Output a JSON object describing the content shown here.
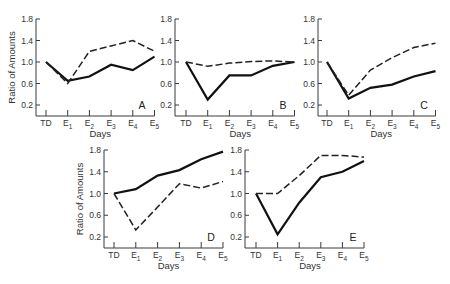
{
  "chart_data": [
    {
      "type": "line",
      "panel": "A",
      "categories": [
        "TD",
        "E1",
        "E2",
        "E3",
        "E4",
        "E5"
      ],
      "series": [
        {
          "name": "solid",
          "values": [
            1.0,
            0.65,
            0.73,
            0.95,
            0.85,
            1.1
          ]
        },
        {
          "name": "dashed",
          "values": [
            1.0,
            0.6,
            1.2,
            1.3,
            1.4,
            1.2
          ]
        }
      ],
      "xlabel": "Days",
      "ylabel": "Ratio of Amounts",
      "yticks": [
        0.2,
        0.6,
        1.0,
        1.4,
        1.8
      ],
      "ylim": [
        0.0,
        1.8
      ]
    },
    {
      "type": "line",
      "panel": "B",
      "categories": [
        "TD",
        "E1",
        "E2",
        "E3",
        "E4",
        "E5"
      ],
      "series": [
        {
          "name": "solid",
          "values": [
            1.0,
            0.3,
            0.75,
            0.75,
            0.93,
            1.0
          ]
        },
        {
          "name": "dashed",
          "values": [
            1.0,
            0.92,
            0.98,
            1.01,
            1.02,
            1.0
          ]
        }
      ],
      "xlabel": "Days",
      "ylabel": "",
      "yticks": [
        0.2,
        0.6,
        1.0,
        1.4,
        1.8
      ],
      "ylim": [
        0.0,
        1.8
      ]
    },
    {
      "type": "line",
      "panel": "C",
      "categories": [
        "TD",
        "E1",
        "E2",
        "E3",
        "E4",
        "E5"
      ],
      "series": [
        {
          "name": "solid",
          "values": [
            1.0,
            0.32,
            0.52,
            0.58,
            0.73,
            0.83
          ]
        },
        {
          "name": "dashed",
          "values": [
            1.0,
            0.38,
            0.85,
            1.08,
            1.27,
            1.35
          ]
        }
      ],
      "xlabel": "Days",
      "ylabel": "",
      "yticks": [
        0.2,
        0.6,
        1.0,
        1.4,
        1.8
      ],
      "ylim": [
        0.0,
        1.8
      ]
    },
    {
      "type": "line",
      "panel": "D",
      "categories": [
        "TD",
        "E1",
        "E2",
        "E3",
        "E4",
        "E5"
      ],
      "series": [
        {
          "name": "solid",
          "values": [
            1.0,
            1.08,
            1.33,
            1.43,
            1.63,
            1.77
          ]
        },
        {
          "name": "dashed",
          "values": [
            1.0,
            0.33,
            0.75,
            1.18,
            1.1,
            1.22
          ]
        }
      ],
      "xlabel": "Days",
      "ylabel": "Ratio of Amounts",
      "yticks": [
        0.2,
        0.6,
        1.0,
        1.4,
        1.8
      ],
      "ylim": [
        0.0,
        1.8
      ]
    },
    {
      "type": "line",
      "panel": "E",
      "categories": [
        "TD",
        "E1",
        "E2",
        "E3",
        "E4",
        "E5"
      ],
      "series": [
        {
          "name": "solid",
          "values": [
            1.0,
            0.25,
            0.83,
            1.3,
            1.4,
            1.6
          ]
        },
        {
          "name": "dashed",
          "values": [
            1.0,
            1.0,
            1.33,
            1.7,
            1.7,
            1.67
          ]
        }
      ],
      "xlabel": "Days",
      "ylabel": "",
      "yticks": [
        0.2,
        0.6,
        1.0,
        1.4,
        1.8
      ],
      "ylim": [
        0.0,
        1.8
      ]
    }
  ],
  "layout": {
    "panels": [
      {
        "ax": 36,
        "ay0": 116,
        "y18": 19,
        "y02": 105,
        "x0": 46,
        "dx": 21.7,
        "showYLabel": true,
        "labelPos": [
          142,
          109
        ]
      },
      {
        "ax": 175,
        "ay0": 116,
        "y18": 19,
        "y02": 105,
        "x0": 186,
        "dx": 21.7,
        "showYLabel": false,
        "labelPos": [
          283,
          109
        ]
      },
      {
        "ax": 318,
        "ay0": 116,
        "y18": 19,
        "y02": 105,
        "x0": 327,
        "dx": 21.7,
        "showYLabel": false,
        "labelPos": [
          424,
          109
        ]
      },
      {
        "ax": 104,
        "ay0": 248,
        "y18": 150,
        "y02": 237,
        "x0": 114,
        "dx": 21.8,
        "showYLabel": true,
        "labelPos": [
          211,
          241
        ]
      },
      {
        "ax": 245,
        "ay0": 248,
        "y18": 150,
        "y02": 237,
        "x0": 256,
        "dx": 21.6,
        "showYLabel": false,
        "labelPos": [
          353,
          241
        ]
      }
    ]
  }
}
